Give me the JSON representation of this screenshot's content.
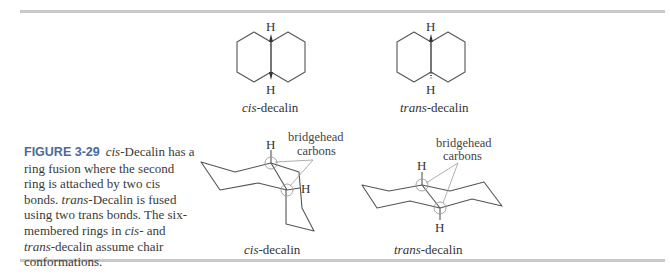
{
  "figure": {
    "number": "FIGURE 3-29",
    "caption_parts": [
      {
        "text": "cis",
        "italic": true
      },
      {
        "text": "-Decalin has a ring fusion where the second ring is attached by two cis bonds. ",
        "italic": false
      },
      {
        "text": "trans",
        "italic": true
      },
      {
        "text": "-Decalin is fused using two trans bonds. The six-membered rings in ",
        "italic": false
      },
      {
        "text": "cis",
        "italic": true
      },
      {
        "text": "- and ",
        "italic": false
      },
      {
        "text": "trans",
        "italic": true
      },
      {
        "text": "-decalin assume chair conformations.",
        "italic": false
      }
    ]
  },
  "structures": {
    "cis_flat": {
      "prefix": "cis",
      "suffix": "-decalin",
      "h_top": "H",
      "h_bottom": "H"
    },
    "trans_flat": {
      "prefix": "trans",
      "suffix": "-decalin",
      "h_top": "H",
      "h_bottom": "H"
    },
    "cis_chair": {
      "prefix": "cis",
      "suffix": "-decalin",
      "h_top": "H",
      "h_side": "H",
      "annot_line1": "bridgehead",
      "annot_line2": "carbons"
    },
    "trans_chair": {
      "prefix": "trans",
      "suffix": "-decalin",
      "h_top": "H",
      "h_bottom": "H",
      "annot_line1": "bridgehead",
      "annot_line2": "carbons"
    }
  },
  "colors": {
    "rule": "#c8c8c8",
    "figure_label": "#4a6a9a",
    "line": "#555555"
  }
}
